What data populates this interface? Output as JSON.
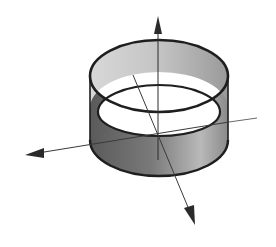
{
  "figure": {
    "subject": "Cylinder (lateral surface) with three coordinate axes",
    "shape": "open cylinder band",
    "axes_count": 3,
    "colors": {
      "background": "#ffffff",
      "outline": "#1e1e1e",
      "surface_dark": "#5a5a5a",
      "surface_light": "#c8c8c8",
      "interior": "#ffffff",
      "axis": "#3a3a3a"
    }
  }
}
